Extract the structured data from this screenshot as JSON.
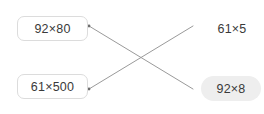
{
  "exercise": {
    "type": "matching-pairs",
    "background_color": "#ffffff",
    "text_color": "#3a3a3a",
    "line_color": "#9a9a9a",
    "box_border_color": "#dcdcdc",
    "highlight_color": "#eeeeee"
  },
  "left_options": [
    {
      "id": "opt-top",
      "label": "92×80"
    },
    {
      "id": "opt-bottom",
      "label": "61×500"
    }
  ],
  "right_targets": [
    {
      "id": "tgt-top",
      "label": "61×5",
      "highlighted": false
    },
    {
      "id": "tgt-bottom",
      "label": "92×8",
      "highlighted": true
    }
  ],
  "connections": [
    {
      "from": "opt-top",
      "to": "tgt-bottom",
      "x1": 89,
      "y1": 26,
      "x2": 193,
      "y2": 89
    },
    {
      "from": "opt-bottom",
      "to": "tgt-top",
      "x1": 89,
      "y1": 89,
      "x2": 193,
      "y2": 26
    }
  ]
}
